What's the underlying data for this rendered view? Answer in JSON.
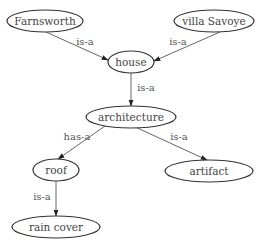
{
  "diagram": {
    "type": "semantic-network",
    "nodes": [
      {
        "id": "farnsworth",
        "label": "Farnsworth",
        "cx": 45,
        "cy": 21,
        "rx": 38,
        "ry": 11
      },
      {
        "id": "villa_savoye",
        "label": "villa Savoye",
        "cx": 214,
        "cy": 21,
        "rx": 40,
        "ry": 11
      },
      {
        "id": "house",
        "label": "house",
        "cx": 131,
        "cy": 62,
        "rx": 23,
        "ry": 11
      },
      {
        "id": "architecture",
        "label": "architecture",
        "cx": 131,
        "cy": 117,
        "rx": 45,
        "ry": 11
      },
      {
        "id": "roof",
        "label": "roof",
        "cx": 56,
        "cy": 170,
        "rx": 23,
        "ry": 11
      },
      {
        "id": "artifact",
        "label": "artifact",
        "cx": 209,
        "cy": 171,
        "rx": 44,
        "ry": 11
      },
      {
        "id": "rain_cover",
        "label": "rain cover",
        "cx": 56,
        "cy": 227,
        "rx": 44,
        "ry": 11
      }
    ],
    "edges": [
      {
        "from": "farnsworth",
        "to": "house",
        "label": "is-a",
        "x1": 46,
        "y1": 32,
        "x2": 108,
        "y2": 60,
        "lx": 85,
        "ly": 41
      },
      {
        "from": "villa_savoye",
        "to": "house",
        "label": "is-a",
        "x1": 220,
        "y1": 32,
        "x2": 154,
        "y2": 61,
        "lx": 178,
        "ly": 41
      },
      {
        "from": "house",
        "to": "architecture",
        "label": "is-a",
        "x1": 131,
        "y1": 73,
        "x2": 131,
        "y2": 106,
        "lx": 146,
        "ly": 87
      },
      {
        "from": "architecture",
        "to": "roof",
        "label": "has-a",
        "x1": 105,
        "y1": 126,
        "x2": 58,
        "y2": 159,
        "lx": 77,
        "ly": 136
      },
      {
        "from": "architecture",
        "to": "artifact",
        "label": "is-a",
        "x1": 133,
        "y1": 126,
        "x2": 207,
        "y2": 160,
        "lx": 179,
        "ly": 136
      },
      {
        "from": "roof",
        "to": "rain_cover",
        "label": "is-a",
        "x1": 56,
        "y1": 181,
        "x2": 56,
        "y2": 216,
        "lx": 42,
        "ly": 196
      }
    ]
  }
}
